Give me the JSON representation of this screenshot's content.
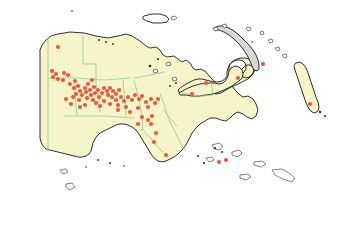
{
  "map": {
    "title": "Papua New Guinea occurrence distribution map",
    "region_name": "Papua New Guinea",
    "projection_note": "equirectangular",
    "background_color": "#ffffff",
    "land_fill_color": "#f6f5c9",
    "coastline_color": "#1a1a1a",
    "province_border_color": "#8fc99b",
    "occurrence_dot_color": "#f0573a",
    "occurrence_dot_radius": 2.1,
    "legend_visible": false,
    "labels_visible": false,
    "graticule_visible": false,
    "scalebar_visible": false,
    "north_arrow_visible": false
  },
  "landmasses": [
    {
      "name": "new-guinea-mainland",
      "label": "Mainland New Guinea (PNG and Papua border)",
      "fill": "#f6f5c9",
      "path": "M 58,34 L 70,32 L 84,33 L 96,36 L 108,38 L 118,36 L 126,34 L 132,36 L 140,41 L 146,46 L 150,48 L 156,47 L 160,50 L 163,55 L 167,57 L 174,56 L 178,59 L 182,62 L 186,60 L 190,63 L 193,68 L 196,70 L 201,69 L 206,72 L 211,78 L 215,82 L 220,84 L 226,83 L 232,86 L 236,91 L 240,95 L 243,97 L 248,96 L 253,99 L 256,104 L 258,110 L 256,116 L 252,119 L 247,117 L 243,114 L 238,112 L 234,114 L 230,118 L 226,121 L 221,120 L 216,118 L 210,118 L 205,121 L 200,124 L 196,128 L 192,133 L 189,139 L 186,145 L 182,150 L 178,154 L 174,157 L 170,159 L 166,161 L 162,162 L 158,161 L 154,158 L 151,154 L 148,149 L 145,144 L 142,139 L 139,134 L 136,130 L 132,127 L 128,125 L 124,124 L 120,124 L 116,125 L 112,127 L 108,129 L 104,131 L 100,133 L 97,136 L 95,139 L 93,143 L 92,147 L 91,151 L 89,154 L 86,156 L 82,157 L 78,157 L 74,156 L 70,155 L 66,154 L 62,153 L 58,152 L 54,151 L 50,150 L 46,149 L 43,146 L 41,142 L 40,138 L 40,134 L 40,128 L 40,120 L 40,112 L 40,104 L 40,96 L 40,88 L 40,80 L 40,72 L 40,64 L 40,56 L 40,50 L 42,45 L 46,40 L 51,36 Z"
    },
    {
      "name": "new-britain",
      "label": "New Britain",
      "fill": "#f6f5c9",
      "path": "M 188,94 L 196,92 L 203,91 L 210,92 L 216,94 L 221,93 L 226,90 L 231,87 L 236,85 L 240,83 L 244,81 L 248,79 L 251,76 L 253,73 L 254,70 L 253,67 L 250,65 L 247,65 L 244,67 L 241,70 L 238,73 L 235,75 L 232,76 L 230,74 L 229,70 L 229,66 L 231,63 L 234,61 L 237,60 L 240,60 L 243,61 L 245,63 L 246,66 L 246,69 L 244,72 L 242,74 L 243,77 L 246,78 L 249,77 L 252,75 L 254,72 L 255,68 L 254,64 L 252,61 L 249,59 L 245,58 L 241,58 L 237,59 L 233,61 L 230,64 L 228,68 L 227,72 L 227,76 L 225,79 L 222,81 L 218,82 L 214,82 L 210,81 L 206,80 L 202,79 L 198,79 L 194,80 L 190,82 L 186,84 L 183,86 L 180,88 L 178,90 L 179,92 L 182,93 Z"
    },
    {
      "name": "new-britain-main-body",
      "label": "New Britain main body",
      "fill": "#f6f5c9",
      "path": "M 179,93 L 186,89 L 193,86 L 200,84 L 207,83 L 214,83 L 219,84 L 223,83 L 226,80 L 228,76 L 229,71 L 231,68 L 235,66 L 239,67 L 242,70 L 243,74 L 242,78 L 239,81 L 236,83 L 232,86 L 228,88 L 224,90 L 219,92 L 213,94 L 206,95 L 199,96 L 192,96 L 186,95 L 181,95 Z"
    },
    {
      "name": "new-ireland",
      "label": "New Ireland",
      "fill": "#d8d8d8",
      "path": "M 214,28 L 219,26 L 224,26 L 229,28 L 234,31 L 239,35 L 244,40 L 249,45 L 253,50 L 256,55 L 258,60 L 259,65 L 259,69 L 257,71 L 254,70 L 252,66 L 250,61 L 247,55 L 243,49 L 239,44 L 234,39 L 229,35 L 224,32 L 219,30 L 215,30 Z"
    },
    {
      "name": "bougainville",
      "label": "Bougainville",
      "fill": "#f6f5c9",
      "path": "M 296,63 L 300,62 L 303,64 L 306,68 L 308,73 L 310,79 L 312,85 L 314,91 L 316,97 L 318,102 L 319,107 L 318,111 L 315,113 L 312,112 L 309,109 L 307,105 L 305,100 L 303,94 L 301,88 L 299,82 L 297,76 L 295,70 L 294,66 Z"
    },
    {
      "name": "manus",
      "label": "Manus Island",
      "fill": "#ffffff",
      "path": "M 144,16 L 152,14 L 160,14 L 166,16 L 169,19 L 167,22 L 161,23 L 153,23 L 147,21 L 143,19 Z"
    }
  ],
  "islands_small": [
    {
      "name": "islet-manus-east",
      "path": "M 171,17 L 175,16 L 177,18 L 174,20 L 171,19 Z"
    },
    {
      "name": "islet-admiralty-a",
      "path": "M 213,28 L 217,27 L 218,30 L 215,31 Z"
    },
    {
      "name": "islet-admiralty-b",
      "path": "M 222,25 L 226,24 L 227,27 L 224,28 Z"
    },
    {
      "name": "islet-north-a",
      "path": "M 246,28 L 250,27 L 251,30 L 248,31 Z"
    },
    {
      "name": "islet-north-b",
      "path": "M 260,32 L 263,31 L 264,34 L 261,35 Z"
    },
    {
      "name": "islet-ne-a",
      "path": "M 268,40 L 272,39 L 273,42 L 270,43 Z"
    },
    {
      "name": "islet-ne-b",
      "path": "M 275,48 L 279,47 L 280,50 L 277,51 Z"
    },
    {
      "name": "islet-ne-c",
      "path": "M 282,55 L 286,54 L 287,57 L 284,58 Z"
    },
    {
      "name": "islet-vitiaz-a",
      "path": "M 153,70 L 157,69 L 158,72 L 154,73 Z"
    },
    {
      "name": "islet-vitiaz-b",
      "path": "M 166,63 L 170,62 L 171,65 L 167,66 Z"
    },
    {
      "name": "islet-siassi",
      "path": "M 172,78 L 176,77 L 177,80 L 173,81 Z"
    },
    {
      "name": "islet-dentre-a",
      "path": "M 212,145 L 219,143 L 223,146 L 220,150 L 214,149 Z"
    },
    {
      "name": "islet-dentre-b",
      "path": "M 232,152 L 239,150 L 242,153 L 238,157 L 232,155 Z"
    },
    {
      "name": "islet-dentre-c",
      "path": "M 206,158 L 212,157 L 214,160 L 209,162 Z"
    },
    {
      "name": "islet-louisiade-a",
      "path": "M 254,162 L 262,161 L 266,164 L 261,167 L 254,165 Z"
    },
    {
      "name": "islet-louisiade-b",
      "path": "M 272,170 L 282,169 L 289,173 L 295,178 L 292,182 L 283,179 L 275,175 Z"
    },
    {
      "name": "islet-louisiade-c",
      "path": "M 240,175 L 248,174 L 251,177 L 246,180 L 240,178 Z"
    },
    {
      "name": "islet-torres-a",
      "path": "M 60,170 L 66,169 L 68,172 L 63,174 Z"
    },
    {
      "name": "islet-torres-b",
      "path": "M 66,184 L 72,183 L 75,187 L 70,190 L 66,187 Z"
    }
  ],
  "dark_islets": [
    {
      "name": "darkislet-vitiaz-1",
      "cx": 150,
      "cy": 66,
      "r": 1.3
    },
    {
      "name": "darkislet-vitiaz-2",
      "cx": 158,
      "cy": 59,
      "r": 1.1
    },
    {
      "name": "darkislet-sepik-1",
      "cx": 99,
      "cy": 40,
      "r": 1.0
    },
    {
      "name": "darkislet-sepik-2",
      "cx": 106,
      "cy": 42,
      "r": 1.0
    },
    {
      "name": "darkislet-sepik-3",
      "cx": 113,
      "cy": 44,
      "r": 0.9
    },
    {
      "name": "darkislet-north-1",
      "cx": 72,
      "cy": 11,
      "r": 0.8
    },
    {
      "name": "darkislet-milne-1",
      "cx": 215,
      "cy": 148,
      "r": 1.1
    },
    {
      "name": "darkislet-milne-2",
      "cx": 222,
      "cy": 152,
      "r": 1.0
    },
    {
      "name": "darkislet-milne-3",
      "cx": 198,
      "cy": 156,
      "r": 1.0
    },
    {
      "name": "darkislet-milne-4",
      "cx": 204,
      "cy": 163,
      "r": 1.0
    },
    {
      "name": "darkislet-papua-1",
      "cx": 98,
      "cy": 160,
      "r": 0.9
    },
    {
      "name": "darkislet-papua-2",
      "cx": 110,
      "cy": 163,
      "r": 0.9
    },
    {
      "name": "darkislet-papua-3",
      "cx": 86,
      "cy": 167,
      "r": 0.8
    },
    {
      "name": "darkislet-papua-4",
      "cx": 124,
      "cy": 166,
      "r": 0.8
    },
    {
      "name": "darkislet-bougainville-1",
      "cx": 320,
      "cy": 112,
      "r": 1.2
    },
    {
      "name": "darkislet-bougainville-2",
      "cx": 325,
      "cy": 116,
      "r": 1.0
    },
    {
      "name": "darkislet-newireland-1",
      "cx": 252,
      "cy": 42,
      "r": 0.8
    },
    {
      "name": "darkislet-newbritain-1",
      "cx": 176,
      "cy": 83,
      "r": 1.0
    },
    {
      "name": "darkislet-newbritain-2",
      "cx": 170,
      "cy": 86,
      "r": 0.9
    }
  ],
  "province_borders": [
    {
      "name": "border-west-papua-international",
      "path": "M 48,38 L 48,62 L 48,88 L 48,114 L 48,140 L 48,152"
    },
    {
      "name": "border-sandaun-east-sepik",
      "path": "M 83,36 L 83,52 L 83,64 L 96,64 L 96,74 L 96,84"
    },
    {
      "name": "border-sepik-south",
      "path": "M 48,78 L 62,78 L 76,78 L 90,79 L 104,80 L 118,79 L 130,78"
    },
    {
      "name": "border-enga-western-highlands",
      "path": "M 96,84 L 98,94 L 99,104 L 100,112"
    },
    {
      "name": "border-southern-highlands-east",
      "path": "M 75,80 L 75,94 L 76,106 L 77,116"
    },
    {
      "name": "border-highlands-south",
      "path": "M 64,116 L 78,116 L 92,116 L 106,116 L 120,117 L 134,118"
    },
    {
      "name": "border-simbu-eastern-highlands",
      "path": "M 123,80 L 124,92 L 125,104 L 126,116"
    },
    {
      "name": "border-morobe-west",
      "path": "M 134,80 L 137,92 L 140,104 L 142,118 L 143,130"
    },
    {
      "name": "border-madang-morobe",
      "path": "M 134,78 L 146,76 L 156,74 L 164,72"
    },
    {
      "name": "border-morobe-east",
      "path": "M 160,94 L 164,104 L 167,114 L 170,122"
    },
    {
      "name": "border-gulf-central",
      "path": "M 143,130 L 150,138 L 157,146 L 163,152"
    },
    {
      "name": "border-central-milne",
      "path": "M 170,122 L 175,132 L 180,142 L 185,150"
    },
    {
      "name": "border-oro-central",
      "path": "M 163,110 L 170,118 L 177,126"
    },
    {
      "name": "border-newbritain-east-west",
      "path": "M 211,83 L 212,88 L 213,94"
    },
    {
      "name": "border-newbritain-coast",
      "path": "M 182,93 L 192,95 L 202,96 L 212,95"
    }
  ],
  "occurrence_points": {
    "label": "Occurrence records",
    "color": "#f0573a",
    "count": 74,
    "points": [
      {
        "id": "p1",
        "x": 52,
        "y": 71
      },
      {
        "id": "p2",
        "x": 56,
        "y": 74
      },
      {
        "id": "p3",
        "x": 53,
        "y": 77
      },
      {
        "id": "p4",
        "x": 58,
        "y": 79
      },
      {
        "id": "p5",
        "x": 64,
        "y": 73
      },
      {
        "id": "p6",
        "x": 68,
        "y": 75
      },
      {
        "id": "p7",
        "x": 63,
        "y": 80
      },
      {
        "id": "p8",
        "x": 58,
        "y": 47
      },
      {
        "id": "p9",
        "x": 70,
        "y": 84
      },
      {
        "id": "p10",
        "x": 75,
        "y": 81
      },
      {
        "id": "p11",
        "x": 78,
        "y": 86
      },
      {
        "id": "p12",
        "x": 74,
        "y": 88
      },
      {
        "id": "p13",
        "x": 80,
        "y": 91
      },
      {
        "id": "p14",
        "x": 76,
        "y": 94
      },
      {
        "id": "p15",
        "x": 82,
        "y": 95
      },
      {
        "id": "p16",
        "x": 73,
        "y": 97
      },
      {
        "id": "p17",
        "x": 79,
        "y": 100
      },
      {
        "id": "p18",
        "x": 85,
        "y": 88
      },
      {
        "id": "p19",
        "x": 88,
        "y": 84
      },
      {
        "id": "p20",
        "x": 92,
        "y": 80
      },
      {
        "id": "p21",
        "x": 86,
        "y": 92
      },
      {
        "id": "p22",
        "x": 90,
        "y": 90
      },
      {
        "id": "p23",
        "x": 94,
        "y": 87
      },
      {
        "id": "p24",
        "x": 91,
        "y": 95
      },
      {
        "id": "p25",
        "x": 87,
        "y": 98
      },
      {
        "id": "p26",
        "x": 95,
        "y": 93
      },
      {
        "id": "p27",
        "x": 98,
        "y": 90
      },
      {
        "id": "p28",
        "x": 93,
        "y": 100
      },
      {
        "id": "p29",
        "x": 99,
        "y": 97
      },
      {
        "id": "p30",
        "x": 102,
        "y": 93
      },
      {
        "id": "p31",
        "x": 96,
        "y": 103
      },
      {
        "id": "p32",
        "x": 80,
        "y": 107
      },
      {
        "id": "p33",
        "x": 85,
        "y": 105
      },
      {
        "id": "p34",
        "x": 71,
        "y": 104
      },
      {
        "id": "p35",
        "x": 66,
        "y": 99
      },
      {
        "id": "p36",
        "x": 104,
        "y": 88
      },
      {
        "id": "p37",
        "x": 107,
        "y": 91
      },
      {
        "id": "p38",
        "x": 110,
        "y": 88
      },
      {
        "id": "p39",
        "x": 113,
        "y": 91
      },
      {
        "id": "p40",
        "x": 108,
        "y": 95
      },
      {
        "id": "p41",
        "x": 112,
        "y": 97
      },
      {
        "id": "p42",
        "x": 116,
        "y": 94
      },
      {
        "id": "p43",
        "x": 119,
        "y": 90
      },
      {
        "id": "p44",
        "x": 116,
        "y": 100
      },
      {
        "id": "p45",
        "x": 121,
        "y": 97
      },
      {
        "id": "p46",
        "x": 104,
        "y": 101
      },
      {
        "id": "p47",
        "x": 100,
        "y": 106
      },
      {
        "id": "p48",
        "x": 110,
        "y": 104
      },
      {
        "id": "p49",
        "x": 118,
        "y": 105
      },
      {
        "id": "p50",
        "x": 124,
        "y": 101
      },
      {
        "id": "p51",
        "x": 128,
        "y": 97
      },
      {
        "id": "p52",
        "x": 132,
        "y": 100
      },
      {
        "id": "p53",
        "x": 126,
        "y": 107
      },
      {
        "id": "p54",
        "x": 118,
        "y": 110
      },
      {
        "id": "p55",
        "x": 135,
        "y": 95
      },
      {
        "id": "p56",
        "x": 139,
        "y": 99
      },
      {
        "id": "p57",
        "x": 142,
        "y": 96
      },
      {
        "id": "p58",
        "x": 146,
        "y": 102
      },
      {
        "id": "p59",
        "x": 151,
        "y": 99
      },
      {
        "id": "p60",
        "x": 155,
        "y": 103
      },
      {
        "id": "p61",
        "x": 158,
        "y": 99
      },
      {
        "id": "p62",
        "x": 148,
        "y": 107
      },
      {
        "id": "p63",
        "x": 138,
        "y": 108
      },
      {
        "id": "p64",
        "x": 130,
        "y": 112
      },
      {
        "id": "p65",
        "x": 142,
        "y": 117
      },
      {
        "id": "p66",
        "x": 148,
        "y": 120
      },
      {
        "id": "p67",
        "x": 152,
        "y": 116
      },
      {
        "id": "p68",
        "x": 151,
        "y": 124
      },
      {
        "id": "p69",
        "x": 138,
        "y": 124
      },
      {
        "id": "p70",
        "x": 156,
        "y": 133
      },
      {
        "id": "p71",
        "x": 154,
        "y": 142
      },
      {
        "id": "p72",
        "x": 166,
        "y": 155
      },
      {
        "id": "p73",
        "x": 192,
        "y": 94
      },
      {
        "id": "p74",
        "x": 206,
        "y": 83
      },
      {
        "id": "p75",
        "x": 238,
        "y": 78
      },
      {
        "id": "p76",
        "x": 263,
        "y": 64
      },
      {
        "id": "p77",
        "x": 310,
        "y": 104
      },
      {
        "id": "p78",
        "x": 219,
        "y": 162
      },
      {
        "id": "p79",
        "x": 226,
        "y": 160
      }
    ]
  }
}
